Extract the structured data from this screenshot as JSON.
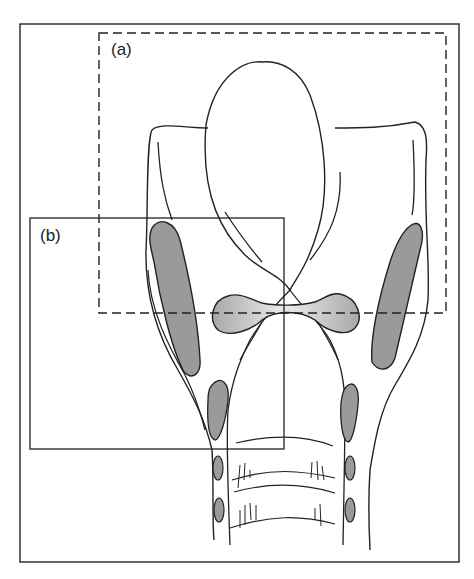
{
  "figure": {
    "regions": [
      {
        "id": "a",
        "label": "(a)",
        "style": "dashed",
        "box": [
          99,
          33,
          446,
          313
        ]
      },
      {
        "id": "b",
        "label": "(b)",
        "style": "solid",
        "box": [
          30,
          218,
          284,
          449
        ]
      }
    ],
    "colors": {
      "line": "#222222",
      "fill_cartilage": "#9a9a9a",
      "fill_fold": "#b5b5b5",
      "background": "#ffffff"
    }
  }
}
